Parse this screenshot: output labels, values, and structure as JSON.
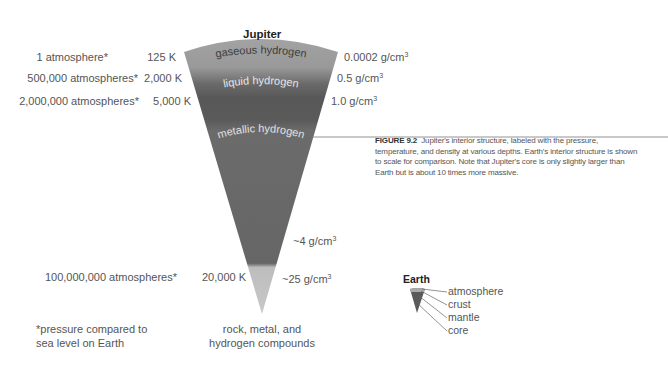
{
  "jupiter": {
    "title": "Jupiter",
    "layers": [
      {
        "name": "gaseous hydrogen",
        "color": "#9a9a9a"
      },
      {
        "name": "liquid hydrogen",
        "color": "#5e5e5e"
      },
      {
        "name": "metallic hydrogen",
        "color": "#6e6e6e"
      },
      {
        "name": "core",
        "color": "#b9b9b9"
      }
    ],
    "pressures": [
      "1 atmosphere*",
      "500,000 atmospheres*",
      "2,000,000 atmospheres*",
      "100,000,000 atmospheres*"
    ],
    "temperatures": [
      "125 K",
      "2,000 K",
      "5,000 K",
      "20,000 K"
    ],
    "densities": [
      {
        "value": "0.0002 g/cm",
        "sup": "3"
      },
      {
        "value": "0.5 g/cm",
        "sup": "3"
      },
      {
        "value": "1.0 g/cm",
        "sup": "3"
      },
      {
        "value": "~4 g/cm",
        "sup": "3"
      },
      {
        "value": "~25 g/cm",
        "sup": "3"
      }
    ],
    "core_label_line1": "rock, metal, and",
    "core_label_line2": "hydrogen compounds"
  },
  "footnote": {
    "line1": "*pressure compared to",
    "line2": "sea level on Earth"
  },
  "caption": {
    "figure_label": "FIGURE 9.2",
    "text": "Jupiter's interior structure, labeled with the pressure, temperature, and density at various depths. Earth's interior structure is shown to scale for comparison. Note that Jupiter's core is only slightly larger than Earth but is about 10 times more massive."
  },
  "earth": {
    "title": "Earth",
    "layers": [
      "atmosphere",
      "crust",
      "mantle",
      "core"
    ]
  }
}
